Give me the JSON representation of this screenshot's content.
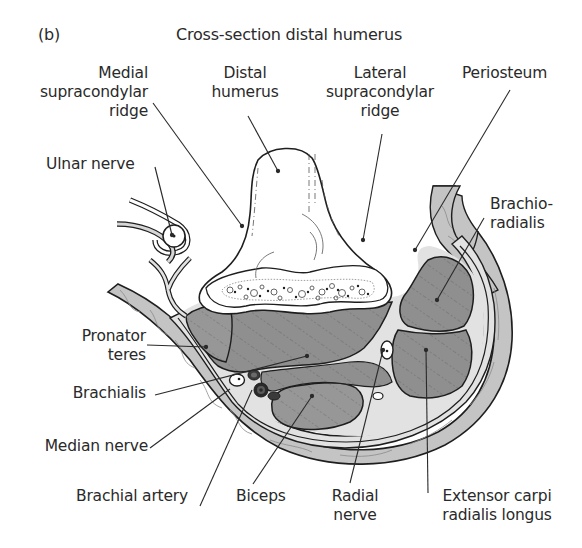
{
  "figure": {
    "panel_label": "(b)",
    "title": "Cross-section distal humerus"
  },
  "labels": {
    "medial_supracondylar_ridge": [
      "Medial",
      "supracondylar",
      "ridge"
    ],
    "distal_humerus": [
      "Distal",
      "humerus"
    ],
    "lateral_supracondylar_ridge": [
      "Lateral",
      "supracondylar",
      "ridge"
    ],
    "periosteum": [
      "Periosteum"
    ],
    "ulnar_nerve": [
      "Ulnar nerve"
    ],
    "brachioradialis": [
      "Brachio-",
      "radialis"
    ],
    "pronator_teres": [
      "Pronator",
      "teres"
    ],
    "brachialis": [
      "Brachialis"
    ],
    "median_nerve": [
      "Median nerve"
    ],
    "brachial_artery": [
      "Brachial artery"
    ],
    "biceps": [
      "Biceps"
    ],
    "radial_nerve": [
      "Radial",
      "nerve"
    ],
    "extensor_carpi_radialis_longus": [
      "Extensor carpi",
      "radialis longus"
    ]
  },
  "colors": {
    "outline": "#1e1e1e",
    "muscle": "#8f8f8f",
    "subcutaneous": "#c4c4c4",
    "fascia": "#e2e2e2",
    "bone": "#ffffff",
    "text": "#2a2a2a"
  }
}
